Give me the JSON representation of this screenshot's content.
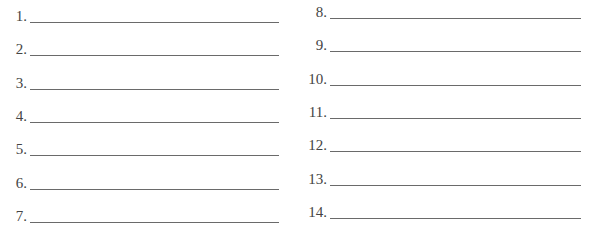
{
  "left_column": [
    {
      "label": "1.",
      "value": ""
    },
    {
      "label": "2.",
      "value": ""
    },
    {
      "label": "3.",
      "value": ""
    },
    {
      "label": "4.",
      "value": ""
    },
    {
      "label": "5.",
      "value": ""
    },
    {
      "label": "6.",
      "value": ""
    },
    {
      "label": "7.",
      "value": ""
    }
  ],
  "right_column": [
    {
      "label": "8.",
      "value": ""
    },
    {
      "label": "9.",
      "value": ""
    },
    {
      "label": "10.",
      "value": ""
    },
    {
      "label": "11.",
      "value": ""
    },
    {
      "label": "12.",
      "value": ""
    },
    {
      "label": "13.",
      "value": ""
    },
    {
      "label": "14.",
      "value": ""
    }
  ]
}
